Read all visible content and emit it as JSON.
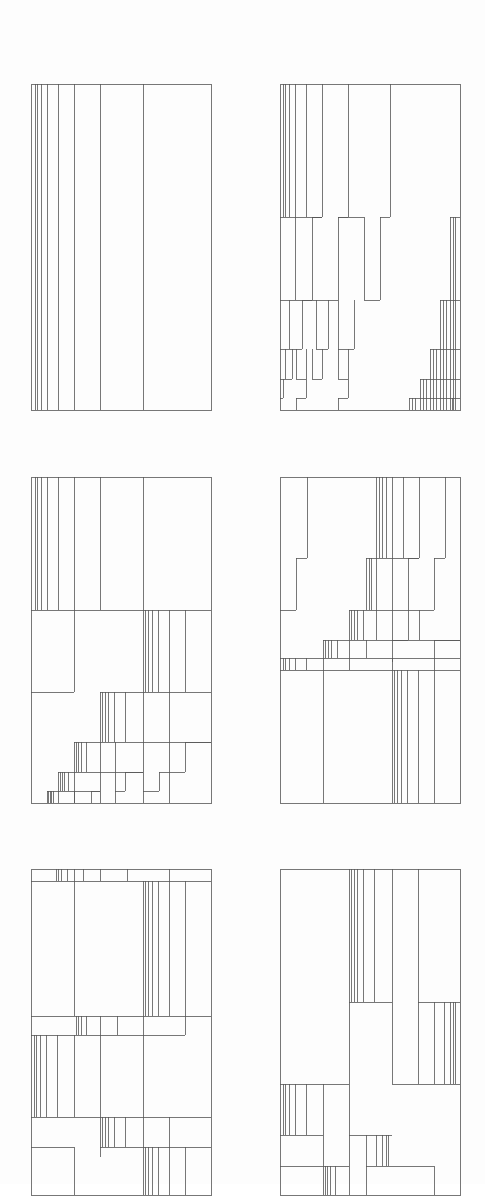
{
  "document": {
    "kind": "generative line-art plate",
    "background": "#fdfdfd",
    "stroke_color": "#555555"
  },
  "column_ratios": [
    0,
    0.022,
    0.033,
    0.056,
    0.089,
    0.15,
    0.239,
    0.383,
    0.622,
    1
  ],
  "panels": [
    {
      "id": "p1",
      "x": 31,
      "y": 84,
      "w": 180,
      "h": 326
    },
    {
      "id": "p2",
      "x": 280,
      "y": 84,
      "w": 180,
      "h": 326
    },
    {
      "id": "p3",
      "x": 31,
      "y": 477,
      "w": 180,
      "h": 326
    },
    {
      "id": "p4",
      "x": 280,
      "y": 477,
      "w": 180,
      "h": 326
    },
    {
      "id": "p5",
      "x": 31,
      "y": 869,
      "w": 180,
      "h": 326
    },
    {
      "id": "p6",
      "x": 280,
      "y": 869,
      "w": 180,
      "h": 326
    }
  ]
}
